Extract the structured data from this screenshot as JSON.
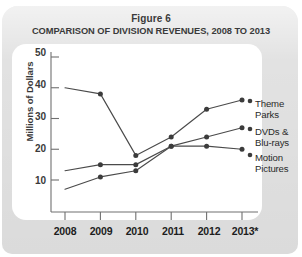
{
  "figure": {
    "number_label": "Figure 6",
    "title": "COMPARISON OF DIVISION REVENUES, 2008 TO 2013"
  },
  "axes": {
    "ylabel": "Millions of Dollars",
    "yticks": [
      "10",
      "20",
      "30",
      "40",
      "50"
    ],
    "xticks": [
      "2008",
      "2009",
      "2010",
      "2011",
      "2012",
      "2013*"
    ]
  },
  "legend": {
    "items": [
      {
        "line1": "Theme",
        "line2": "Parks"
      },
      {
        "line1": "DVDs &",
        "line2": "Blu-rays"
      },
      {
        "line1": "Motion",
        "line2": "Pictures"
      }
    ]
  },
  "colors": {
    "line": "#4a4a4a",
    "marker": "#3c3c3c",
    "axis": "#6e6e6e",
    "panel": "#ffffff",
    "card": "#e2e2e2",
    "text": "#3a3a3a"
  },
  "chart_data": {
    "type": "line",
    "title": "COMPARISON OF DIVISION REVENUES, 2008 TO 2013",
    "subtitle": "Figure 6",
    "xlabel": "",
    "ylabel": "Millions of Dollars",
    "x": [
      "2008",
      "2009",
      "2010",
      "2011",
      "2012",
      "2013*"
    ],
    "ylim": [
      0,
      50
    ],
    "yticks": [
      10,
      20,
      30,
      40,
      50
    ],
    "grid": false,
    "legend_position": "right",
    "footnote_marker": "*",
    "series": [
      {
        "name": "Motion Pictures",
        "values": [
          40,
          38,
          18,
          24,
          33,
          36
        ]
      },
      {
        "name": "DVDs & Blu-rays",
        "values": [
          13,
          15,
          15,
          21,
          24,
          27
        ]
      },
      {
        "name": "Theme Parks",
        "values": [
          7,
          11,
          13,
          21,
          21,
          20
        ]
      }
    ],
    "legend_order_top_to_bottom": [
      "Theme Parks",
      "DVDs & Blu-rays",
      "Motion Pictures"
    ]
  }
}
